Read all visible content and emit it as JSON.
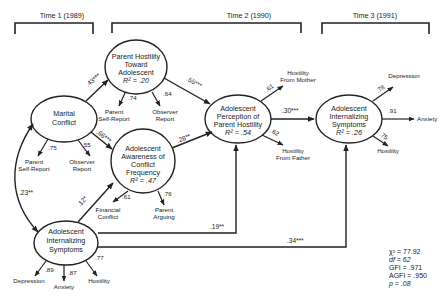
{
  "time_periods": [
    {
      "label": "Time 1 (1989)"
    },
    {
      "label": "Time 2 (1990)"
    },
    {
      "label": "Time 3 (1991)"
    }
  ],
  "latent_nodes": {
    "marital_conflict": {
      "lines": [
        "Marital",
        "Conflict"
      ]
    },
    "parent_hostility": {
      "lines": [
        "Parent Hostility",
        "Toward",
        "Adolescent"
      ],
      "r2": "R² = .20"
    },
    "awareness": {
      "lines": [
        "Adolescent",
        "Awareness of",
        "Conflict",
        "Frequency"
      ],
      "r2": "R² = .47"
    },
    "perception": {
      "lines": [
        "Adolescent",
        "Perception of",
        "Parent Hostility"
      ],
      "r2": "R² = .54"
    },
    "internalizing_t1": {
      "lines": [
        "Adolescent",
        "Internalizing",
        "Symptoms"
      ]
    },
    "internalizing_t3": {
      "lines": [
        "Adolescent",
        "Internalizing",
        "Symptoms"
      ],
      "r2": "R² = .26"
    }
  },
  "indicators": {
    "marital_conflict": [
      {
        "label": [
          "Parent",
          "Self-Report"
        ],
        "loading": ".75"
      },
      {
        "label": [
          "Observer",
          "Report"
        ],
        "loading": ".55"
      }
    ],
    "parent_hostility": [
      {
        "label": [
          "Parent",
          "Self-Report"
        ],
        "loading": ".74"
      },
      {
        "label": [
          "Observer",
          "Report"
        ],
        "loading": ".64"
      }
    ],
    "awareness": [
      {
        "label": [
          "Financial",
          "Conflict"
        ],
        "loading": ".61"
      },
      {
        "label": [
          "Parent",
          "Arguing"
        ],
        "loading": ".76"
      }
    ],
    "perception": [
      {
        "label": [
          "Hostility",
          "From Mother"
        ],
        "loading": ".61"
      },
      {
        "label": [
          "Hostility",
          "From Father"
        ],
        "loading": ".62"
      }
    ],
    "internalizing_t1": [
      {
        "label": [
          "Depression"
        ],
        "loading": ".89"
      },
      {
        "label": [
          "Anxiety"
        ],
        "loading": ".87"
      },
      {
        "label": [
          "Hostility"
        ],
        "loading": ".77"
      }
    ],
    "internalizing_t3": [
      {
        "label": [
          "Depression"
        ],
        "loading": ".78"
      },
      {
        "label": [
          "Anxiety"
        ],
        "loading": ".91"
      },
      {
        "label": [
          "Hostility"
        ],
        "loading": ".75"
      }
    ]
  },
  "paths": [
    {
      "from": "Marital Conflict",
      "to": "Parent Hostility Toward Adolescent",
      "coef": ".43***"
    },
    {
      "from": "Marital Conflict",
      "to": "Adolescent Awareness of Conflict Frequency",
      "coef": ".66***"
    },
    {
      "from": "Parent Hostility Toward Adolescent",
      "to": "Adolescent Perception of Parent Hostility",
      "coef": ".55***"
    },
    {
      "from": "Adolescent Awareness of Conflict Frequency",
      "to": "Adolescent Perception of Parent Hostility",
      "coef": ".28**"
    },
    {
      "from": "Adolescent Perception of Parent Hostility",
      "to": "Adolescent Internalizing Symptoms (T3)",
      "coef": ".30***"
    },
    {
      "from": "Adolescent Internalizing Symptoms (T1)",
      "to": "Adolescent Awareness of Conflict Frequency",
      "coef": ".12*"
    },
    {
      "from": "Adolescent Internalizing Symptoms (T1)",
      "to": "Adolescent Perception of Parent Hostility",
      "coef": ".19**"
    },
    {
      "from": "Adolescent Internalizing Symptoms (T1)",
      "to": "Adolescent Internalizing Symptoms (T3)",
      "coef": ".34***"
    },
    {
      "from": "Marital Conflict",
      "to": "Adolescent Internalizing Symptoms (T1)",
      "coef": ".23**",
      "type": "correlation"
    }
  ],
  "fit_stats": [
    {
      "label": "χ² = 77.92"
    },
    {
      "label": "df = 62"
    },
    {
      "label": "GFI = .971"
    },
    {
      "label": "AGFI = .950"
    },
    {
      "label": "p = .08"
    }
  ]
}
